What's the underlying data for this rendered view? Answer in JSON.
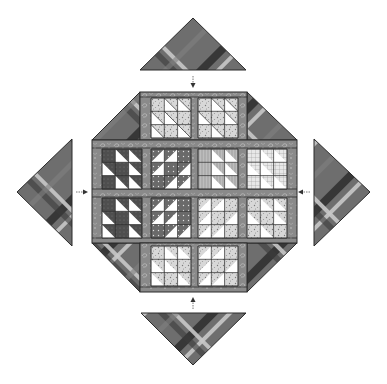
{
  "diagram": {
    "colors": {
      "background": "#ffffff",
      "sashing": "#8a8a8a",
      "sashing_paisley": "#b0b0b0",
      "plaid_base": "#6e6e6e",
      "plaid_dark_stripe": "#2a2a2a",
      "plaid_light_stripe": "#c8c8c8",
      "block_dark": "#5a5a5a",
      "block_light": "#ffffff",
      "block_print": "#cfcfcf",
      "outline": "#2b2b2b",
      "arrow": "#333333"
    },
    "setting_triangles": [
      {
        "id": "top",
        "position": "top",
        "arrow_direction": "down"
      },
      {
        "id": "left",
        "position": "left",
        "arrow_direction": "right"
      },
      {
        "id": "right",
        "position": "right",
        "arrow_direction": "left"
      },
      {
        "id": "bottom",
        "position": "bottom",
        "arrow_direction": "up"
      }
    ],
    "block_rows": [
      {
        "row": 1,
        "block_count": 2,
        "style": "light print half-square triangles"
      },
      {
        "row": 2,
        "block_count": 4,
        "style": "dark, dotted, plaid, grid prints"
      },
      {
        "row": 3,
        "block_count": 4,
        "style": "dark, dotted, light print, speckled"
      },
      {
        "row": 4,
        "block_count": 2,
        "style": "light print half-square triangles"
      }
    ],
    "corner_triangles": 4,
    "total_blocks": 12
  }
}
